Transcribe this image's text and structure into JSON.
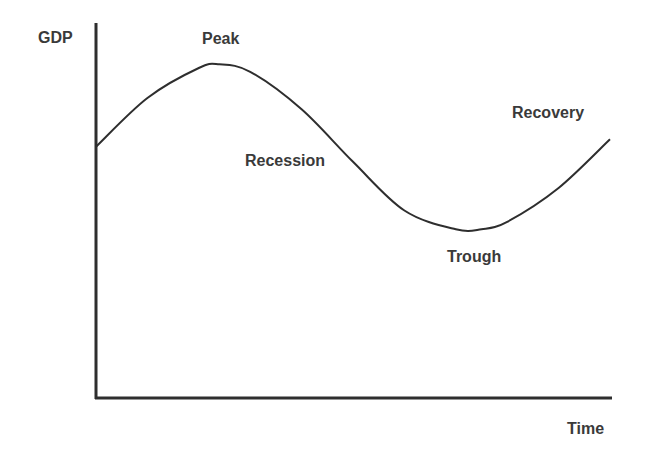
{
  "chart_data": {
    "type": "line",
    "title": "",
    "xlabel": "Time",
    "ylabel": "GDP",
    "grid": false,
    "legend": null,
    "axes": {
      "x_ticks": [],
      "y_ticks": []
    },
    "series": [
      {
        "name": "Business cycle",
        "shape": "sine-like wave",
        "x": [
          0,
          0.1,
          0.2,
          0.24,
          0.3,
          0.4,
          0.5,
          0.6,
          0.7,
          0.75,
          0.8,
          0.9,
          1.0
        ],
        "y": [
          0.67,
          0.8,
          0.88,
          0.89,
          0.87,
          0.77,
          0.63,
          0.5,
          0.45,
          0.45,
          0.47,
          0.56,
          0.69
        ]
      }
    ],
    "x_range": [
      0,
      1
    ],
    "y_range": [
      0,
      1
    ],
    "annotations": [
      {
        "id": "peak",
        "text": "Peak",
        "x": 0.24,
        "y": 0.89
      },
      {
        "id": "recession",
        "text": "Recession",
        "x": 0.5,
        "y": 0.63
      },
      {
        "id": "trough",
        "text": "Trough",
        "x": 0.75,
        "y": 0.45
      },
      {
        "id": "recovery",
        "text": "Recovery",
        "x": 0.95,
        "y": 0.69
      }
    ]
  },
  "colors": {
    "line": "#2e2e2e",
    "axis": "#2e2e2e",
    "text": "#3a3a3a"
  }
}
